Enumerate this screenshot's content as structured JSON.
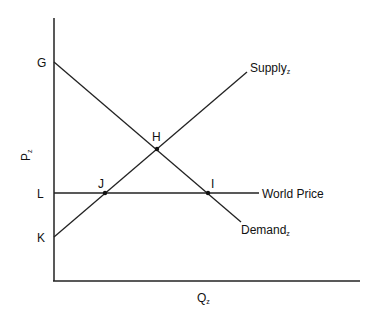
{
  "diagram": {
    "type": "supply-demand",
    "axes": {
      "y_label": "P",
      "y_label_subscript": "z",
      "x_label": "Q",
      "x_label_subscript": "z"
    },
    "curves": {
      "supply": {
        "label": "Supply",
        "subscript": "z"
      },
      "demand": {
        "label": "Demand",
        "subscript": "z"
      },
      "world_price": {
        "label": "World Price"
      }
    },
    "points": {
      "G": "G",
      "H": "H",
      "L": "L",
      "J": "J",
      "I": "I",
      "K": "K"
    },
    "colors": {
      "line": "#222222",
      "background": "#ffffff"
    }
  }
}
